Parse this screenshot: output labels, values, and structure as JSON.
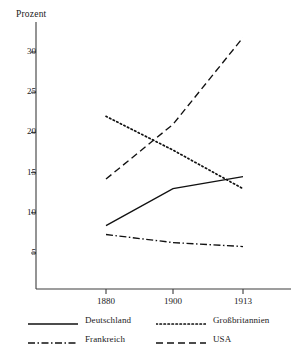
{
  "chart_data": {
    "type": "line",
    "title": "",
    "xlabel": "",
    "ylabel": "Prozent",
    "categories": [
      "1880",
      "1900",
      "1913"
    ],
    "x": [
      1880,
      1900,
      1913
    ],
    "xlim": [
      1872,
      1921
    ],
    "ylim": [
      0,
      34
    ],
    "grid": false,
    "legend_position": "bottom",
    "y_ticks": [
      5,
      10,
      15,
      20,
      25,
      30
    ],
    "y_tick_labels": [
      "5",
      "10",
      "15",
      "20",
      "25",
      "30"
    ],
    "x_ticks": [
      1880,
      1900,
      1913
    ],
    "x_tick_labels": [
      "1880",
      "1900",
      "1913"
    ],
    "series": [
      {
        "name": "Deutschland",
        "values": [
          8.4,
          13.0,
          14.5
        ],
        "style": "solid",
        "color": "#111111",
        "dasharray": ""
      },
      {
        "name": "Großbritannien",
        "values": [
          22.0,
          17.8,
          13.0
        ],
        "style": "dotted",
        "color": "#111111",
        "dasharray": "1.4 2.6"
      },
      {
        "name": "Frankreich",
        "values": [
          7.3,
          6.3,
          5.8
        ],
        "style": "dash-dot",
        "color": "#111111",
        "dasharray": "7 2.5 1.5 2.5"
      },
      {
        "name": "USA",
        "values": [
          14.2,
          21.0,
          31.8
        ],
        "style": "dashed",
        "color": "#111111",
        "dasharray": "7 4"
      }
    ]
  },
  "legend": {
    "entries": [
      {
        "label": "Deutschland"
      },
      {
        "label": "Großbritannien"
      },
      {
        "label": "Frankreich"
      },
      {
        "label": "USA"
      }
    ]
  },
  "colors": {
    "axis": "#3c3c3c",
    "ink": "#111111",
    "background": "#ffffff"
  }
}
